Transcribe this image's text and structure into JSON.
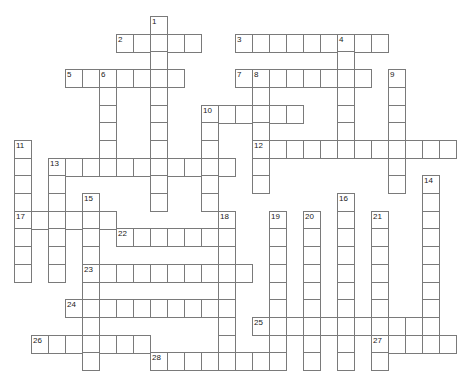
{
  "puzzle": {
    "origin_x": 14,
    "origin_y": 16,
    "cell_w": 17,
    "cell_h": 17.7,
    "border_color": "#7a7a7a",
    "entries": [
      {
        "num": "1",
        "dir": "down",
        "row": 0,
        "col": 8,
        "len": 11
      },
      {
        "num": "2",
        "dir": "across",
        "row": 1,
        "col": 6,
        "len": 5
      },
      {
        "num": "3",
        "dir": "across",
        "row": 1,
        "col": 13,
        "len": 9
      },
      {
        "num": "4",
        "dir": "down",
        "row": 1,
        "col": 19,
        "len": 7
      },
      {
        "num": "5",
        "dir": "across",
        "row": 3,
        "col": 3,
        "len": 7
      },
      {
        "num": "6",
        "dir": "down",
        "row": 3,
        "col": 5,
        "len": 6
      },
      {
        "num": "7",
        "dir": "across",
        "row": 3,
        "col": 13,
        "len": 8
      },
      {
        "num": "8",
        "dir": "down",
        "row": 3,
        "col": 14,
        "len": 7
      },
      {
        "num": "9",
        "dir": "down",
        "row": 3,
        "col": 22,
        "len": 7
      },
      {
        "num": "10",
        "dir": "across",
        "row": 5,
        "col": 11,
        "len": 6
      },
      {
        "num": "10",
        "dir": "down",
        "row": 5,
        "col": 11,
        "len": 6
      },
      {
        "num": "11",
        "dir": "down",
        "row": 7,
        "col": 0,
        "len": 8
      },
      {
        "num": "12",
        "dir": "across",
        "row": 7,
        "col": 14,
        "len": 12
      },
      {
        "num": "13",
        "dir": "across",
        "row": 8,
        "col": 2,
        "len": 11
      },
      {
        "num": "13",
        "dir": "down",
        "row": 8,
        "col": 2,
        "len": 7
      },
      {
        "num": "14",
        "dir": "down",
        "row": 9,
        "col": 24,
        "len": 9
      },
      {
        "num": "15",
        "dir": "down",
        "row": 10,
        "col": 4,
        "len": 10
      },
      {
        "num": "16",
        "dir": "down",
        "row": 10,
        "col": 19,
        "len": 10
      },
      {
        "num": "17",
        "dir": "across",
        "row": 11,
        "col": 0,
        "len": 6
      },
      {
        "num": "18",
        "dir": "down",
        "row": 11,
        "col": 12,
        "len": 9
      },
      {
        "num": "19",
        "dir": "down",
        "row": 11,
        "col": 15,
        "len": 9
      },
      {
        "num": "20",
        "dir": "down",
        "row": 11,
        "col": 17,
        "len": 9
      },
      {
        "num": "21",
        "dir": "down",
        "row": 11,
        "col": 21,
        "len": 9
      },
      {
        "num": "22",
        "dir": "across",
        "row": 12,
        "col": 6,
        "len": 7
      },
      {
        "num": "23",
        "dir": "across",
        "row": 14,
        "col": 4,
        "len": 10
      },
      {
        "num": "24",
        "dir": "across",
        "row": 16,
        "col": 3,
        "len": 10
      },
      {
        "num": "25",
        "dir": "across",
        "row": 17,
        "col": 14,
        "len": 11
      },
      {
        "num": "26",
        "dir": "across",
        "row": 18,
        "col": 1,
        "len": 7
      },
      {
        "num": "27",
        "dir": "across",
        "row": 18,
        "col": 21,
        "len": 5
      },
      {
        "num": "28",
        "dir": "across",
        "row": 19,
        "col": 8,
        "len": 8
      }
    ]
  }
}
